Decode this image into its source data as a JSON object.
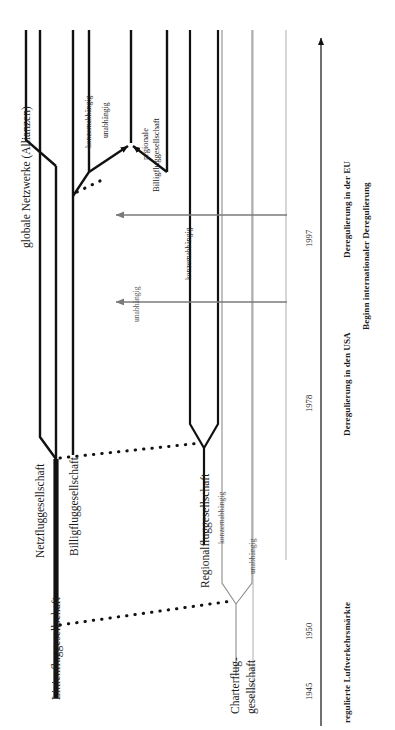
{
  "figure": {
    "type": "timeline-evolution-diagram",
    "orientation": "rotated-90-ccw",
    "language": "de",
    "background": "#ffffff",
    "ink_black": "#111111",
    "ink_gray": "#7a7a7a"
  },
  "axis": {
    "name": "zeitachse",
    "direction": "upward-arrow",
    "years": [
      "1945",
      "1950",
      "1978",
      "1997"
    ],
    "eras": [
      {
        "label": "regulierte Luftverkehrsmärkte",
        "bold": true
      },
      {
        "label": "Deregulierung in den USA",
        "bold": true
      },
      {
        "label": "Deregulierung in der EU",
        "bold": true
      },
      {
        "label": "Beginn internationaler Deregulierung",
        "bold": true
      }
    ]
  },
  "tracks": [
    {
      "id": "linienfluggesellschaft",
      "label": "Linienfluggesellschaft",
      "weight": "heavy"
    },
    {
      "id": "netzfluggesellschaft",
      "label": "Netzfluggesellschaft",
      "weight": "heavy"
    },
    {
      "id": "globale-netzwerke",
      "label": "globale Netzwerke (Allianzen)",
      "weight": "heavy"
    },
    {
      "id": "billigfluggesellschaft",
      "label": "Billigfluggesellschaft",
      "weight": "heavy"
    },
    {
      "id": "regionalfluggesellschaft",
      "label": "Regionalfluggesellschaft",
      "weight": "heavy"
    },
    {
      "id": "regionale-billigfluggesellschaft",
      "label": "regionale\nBilligfluggesellschaft",
      "weight": "heavy"
    },
    {
      "id": "charterfluggesellschaft",
      "label": "Charterflug-\ngesellschaft",
      "weight": "light"
    }
  ],
  "branch_labels": [
    {
      "id": "b1",
      "text": "konzernabhängig",
      "tone": "black"
    },
    {
      "id": "b2",
      "text": "unabhängig",
      "tone": "black"
    },
    {
      "id": "b3",
      "text": "konzernabhängig",
      "tone": "black"
    },
    {
      "id": "b4",
      "text": "unabhängig",
      "tone": "gray"
    },
    {
      "id": "b5",
      "text": "konzernabhängig",
      "tone": "gray"
    },
    {
      "id": "b6",
      "text": "unabhängig",
      "tone": "gray"
    }
  ],
  "label_text": {
    "globale_netzwerke": "globale Netzwerke (Allianzen)",
    "netzfluggesellschaft": "Netzfluggesellschaft",
    "linienfluggesellschaft": "Linienfluggesellschaft",
    "billigfluggesellschaft": "Billigfluggesellschaft",
    "regionalfluggesellschaft": "Regionalfluggesellschaft",
    "regionale_billig_1": "regionale",
    "regionale_billig_2": "Billigfluggesellschaft",
    "charter_1": "Charterflug-",
    "charter_2": "gesellschaft",
    "konzernabhaengig_1": "konzernabhängig",
    "unabhaengig_1": "unabhängig",
    "konzernabhaengig_2": "konzernabhängig",
    "unabhaengig_2": "unabhängig",
    "konzernabhaengig_3": "konzernabhängig",
    "unabhaengig_3": "unabhängig",
    "year_1945": "1945",
    "year_1950": "1950",
    "year_1978": "1978",
    "year_1997": "1997",
    "era_regulierte": "regulierte Luftverkehrsmärkte",
    "era_usa": "Deregulierung in den USA",
    "era_eu": "Deregulierung in der EU",
    "era_intl": "Beginn internationaler Deregulierung"
  },
  "connectors": {
    "gray_arrows": [
      {
        "id": "arrow-eu",
        "from_year": "1997",
        "to_track": "billigfluggesellschaft"
      },
      {
        "id": "arrow-usa",
        "from_year": "1978",
        "to_track": "billigfluggesellschaft"
      }
    ],
    "dotted_links": [
      {
        "from": "linienfluggesellschaft",
        "to": "charterfluggesellschaft"
      },
      {
        "from": "linienfluggesellschaft",
        "to": "regionalfluggesellschaft"
      },
      {
        "from": "billigfluggesellschaft",
        "to": "regionale-billigfluggesellschaft"
      }
    ]
  }
}
